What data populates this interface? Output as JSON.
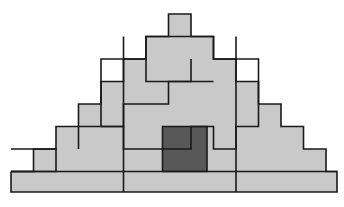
{
  "figure": {
    "title": "Overlapping staircase pyramid tiling figure",
    "type": "geometric-line-figure",
    "canvas": {
      "width": 344,
      "height": 207,
      "background": "#ffffff"
    },
    "grid": {
      "cell": 22.5,
      "origin_x": 11,
      "origin_y": 11.5,
      "cols": 15,
      "rows": 8
    },
    "colors": {
      "light_fill": "#c9c9c9",
      "dark_fill": "#585858",
      "outline": "#1a1a1a"
    },
    "shapes": [
      {
        "name": "outer-pyramid-silhouette",
        "role": "background-staircase",
        "fill": "light",
        "points": "11,171.5 33.5,171.5 33.5,149 56,149 56,126.5 78.5,126.5 78.5,104 101,104 101,81.5 123.5,81.5 123.5,59 146,59 146,36.5 168.5,36.5 168.5,14 191,14 191,36.5 213.5,36.5 213.5,59 236,59 236,81.5 258.5,81.5 258.5,104 281,104 281,126.5 303.5,126.5 303.5,149 326,149 326,171.5 337,171.5 337,192 11,192"
      },
      {
        "name": "central-cross-column",
        "role": "cross-overlay",
        "fill": "light",
        "points": "168.5,14 191,14 191,36.5 213.5,36.5 213.5,59 191,59 191,81.5 168.5,81.5 168.5,59 146,59 146,36.5 168.5,36.5"
      },
      {
        "name": "left-mid-step-block",
        "role": "staircase-overlay",
        "fill": "light",
        "points": "56,126.5 78.5,126.5 78.5,104 123.5,104 123.5,81.5 168.5,81.5 168.5,126.5 56,126.5"
      },
      {
        "name": "right-mid-step-block",
        "role": "staircase-overlay",
        "fill": "light",
        "points": "191,81.5 236,81.5 236,104 258.5,104 258.5,126.5 303.5,126.5 303.5,149 191,149"
      },
      {
        "name": "lower-left-staircase",
        "role": "staircase-overlay",
        "fill": "light",
        "points": "33.5,171.5 56,171.5 56,149 101,149 101,126.5 168.5,126.5 168.5,171.5 33.5,171.5"
      },
      {
        "name": "highlighted-cell",
        "role": "accent-square",
        "fill": "dark",
        "points": "162.5,126.5 207,126.5 207,171.5 162.5,171.5"
      },
      {
        "name": "base-bar",
        "role": "foundation",
        "fill": "light",
        "points": "11,171.5 337,171.5 337,192 11,192"
      }
    ],
    "outlines": [
      {
        "name": "silhouette-outline",
        "points": "11,171.5 33.5,171.5 33.5,149 56,149 56,126.5 78.5,126.5 78.5,104 101,104 101,81.5 123.5,81.5 123.5,59 146,59 146,36.5 168.5,36.5 168.5,14 191,14 191,36.5 213.5,36.5 213.5,59 236,59 236,81.5 258.5,81.5 258.5,104 281,104 281,126.5 303.5,126.5 303.5,149 326,149 326,171.5 337,171.5 337,192 11,192 11,171.5"
      },
      {
        "name": "cross-outline",
        "points": "101,126.5 101,59 146,59 146,36.5 213.5,36.5 213.5,59 258.5,59 258.5,126.5 236,126.5 236,149 213.5,149 213.5,126.5 191,126.5 191,149 123.5,149 123.5,126.5 101,126.5"
      },
      {
        "name": "inner-notch-outline",
        "points": "146,59 146,81.5 191,81.5 191,59"
      },
      {
        "name": "left-step-outline",
        "points": "78.5,149 78.5,126.5 123.5,126.5 123.5,104 168.5,104 168.5,81.5 213.5,81.5"
      },
      {
        "name": "mid-vertical-left",
        "points": "123.5,36.5 123.5,192"
      },
      {
        "name": "mid-vertical-right",
        "points": "236,36.5 236,192"
      },
      {
        "name": "lower-left-step-outline",
        "points": "11,149 56,149 56,171.5 11,171.5"
      },
      {
        "name": "base-top-line",
        "points": "11,171.5 337,171.5"
      }
    ]
  }
}
